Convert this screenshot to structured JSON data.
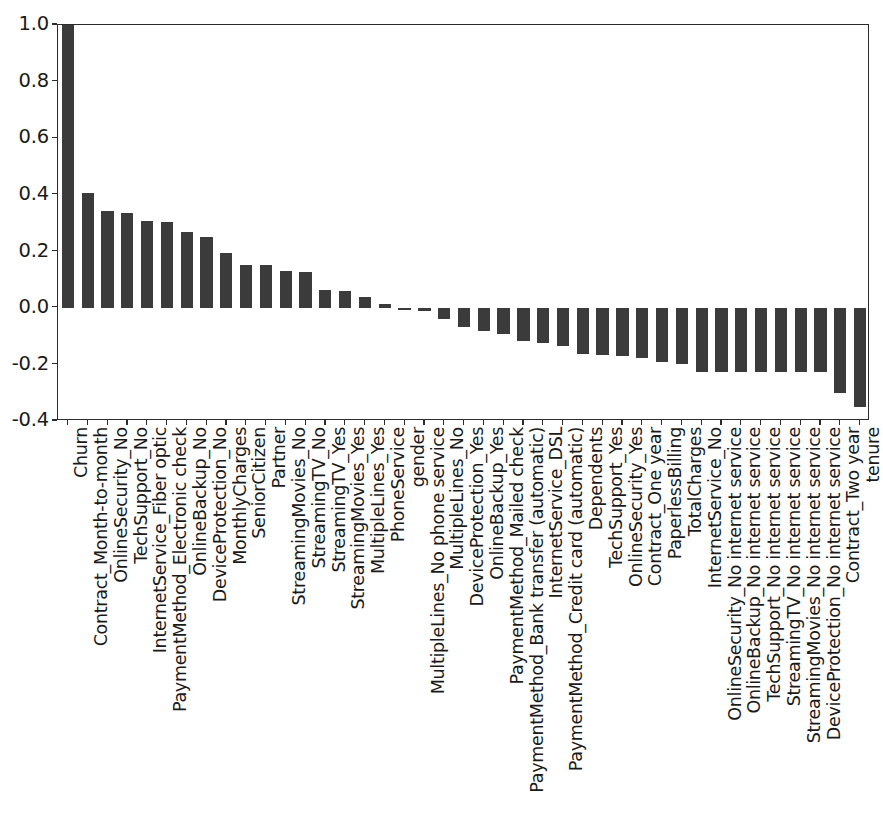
{
  "chart_data": {
    "type": "bar",
    "title": "",
    "subtitle": "",
    "xlabel": "",
    "ylabel": "",
    "ylim": [
      -0.4,
      1.0
    ],
    "xlim_note": "categorical, 41 features",
    "grid": false,
    "legend": null,
    "yticks": [
      "1.0",
      "0.8",
      "0.6",
      "0.4",
      "0.2",
      "0.0",
      "-0.2",
      "-0.4"
    ],
    "ytick_values": [
      1.0,
      0.8,
      0.6,
      0.4,
      0.2,
      0.0,
      -0.2,
      -0.4
    ],
    "bar_color": "#3b3b3b",
    "axis_color": "#2b2b2b",
    "background_color": "#ffffff",
    "orientation": "vertical",
    "categories": [
      "Churn",
      "Contract_Month-to-month",
      "OnlineSecurity_No",
      "TechSupport_No",
      "InternetService_Fiber optic",
      "PaymentMethod_Electronic check",
      "OnlineBackup_No",
      "DeviceProtection_No",
      "MonthlyCharges",
      "SeniorCitizen",
      "Partner",
      "StreamingMovies_No",
      "StreamingTV_No",
      "StreamingTV_Yes",
      "StreamingMovies_Yes",
      "MultipleLines_Yes",
      "PhoneService",
      "gender",
      "MultipleLines_No phone service",
      "MultipleLines_No",
      "DeviceProtection_Yes",
      "OnlineBackup_Yes",
      "PaymentMethod_Mailed check",
      "PaymentMethod_Bank transfer (automatic)",
      "InternetService_DSL",
      "PaymentMethod_Credit card (automatic)",
      "Dependents",
      "TechSupport_Yes",
      "OnlineSecurity_Yes",
      "Contract_One year",
      "PaperlessBilling",
      "TotalCharges",
      "InternetService_No",
      "OnlineSecurity_No internet service",
      "OnlineBackup_No internet service",
      "TechSupport_No internet service",
      "StreamingTV_No internet service",
      "StreamingMovies_No internet service",
      "DeviceProtection_No internet service",
      "Contract_Two year",
      "tenure"
    ],
    "values": [
      1.0,
      0.405,
      0.343,
      0.337,
      0.308,
      0.302,
      0.268,
      0.252,
      0.193,
      0.151,
      0.15,
      0.13,
      0.128,
      0.063,
      0.061,
      0.04,
      0.012,
      -0.009,
      -0.012,
      -0.04,
      -0.066,
      -0.082,
      -0.091,
      -0.118,
      -0.124,
      -0.134,
      -0.164,
      -0.165,
      -0.171,
      -0.178,
      -0.192,
      -0.199,
      -0.228,
      -0.228,
      -0.228,
      -0.228,
      -0.228,
      -0.228,
      -0.228,
      -0.302,
      -0.352
    ]
  }
}
